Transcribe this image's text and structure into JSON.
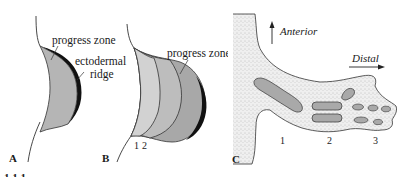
{
  "panels": {
    "A": {
      "letter": "A",
      "labels": {
        "progress_zone": "progress zone",
        "ectodermal_line1": "ectodermal",
        "ectodermal_line2": "ridge"
      }
    },
    "B": {
      "letter": "B",
      "labels": {
        "progress_zone": "progress zone",
        "num1": "1",
        "num2": "2"
      }
    },
    "C": {
      "letter": "C",
      "labels": {
        "anterior": "Anterior",
        "distal": "Distal",
        "num1": "1",
        "num2": "2",
        "num3": "3"
      }
    }
  },
  "caption_fragment": "1.1.1 ...",
  "colors": {
    "progress_zone_a": "#b5b5b5",
    "zone_light": "#d2d2d2",
    "zone_mid": "#bdbdbd",
    "zone_dark": "#a8a8a8",
    "ridge": "#111111",
    "limb_stipple": "#ebebeb",
    "cartilage": "#a9a9a9",
    "outline": "#333333"
  }
}
